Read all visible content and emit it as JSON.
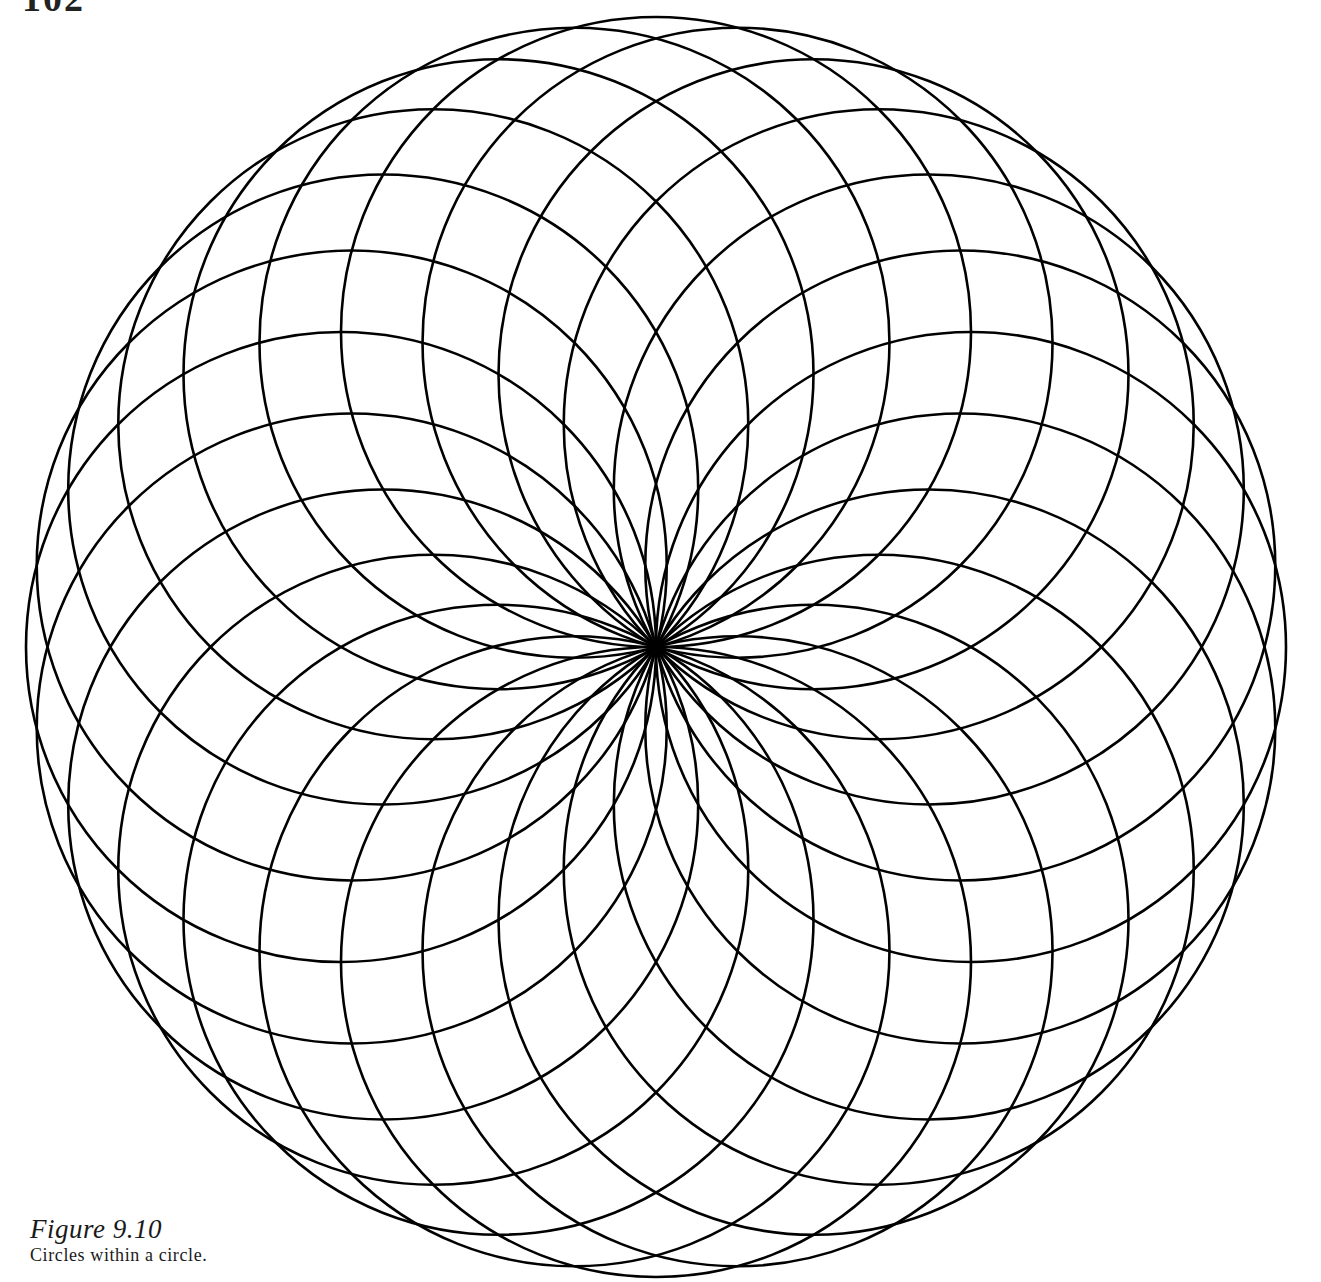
{
  "page": {
    "number": "102"
  },
  "figure": {
    "label": "Figure 9.10",
    "caption": "Circles within a circle.",
    "style": {
      "stroke_color": "#000000",
      "stroke_width": 2.6,
      "background": "#ffffff"
    },
    "geometry": {
      "center_x": 656,
      "center_y": 647,
      "circle_count": 24,
      "circle_radius": 315,
      "ring_radius": 315,
      "start_angle_deg": 0
    }
  }
}
